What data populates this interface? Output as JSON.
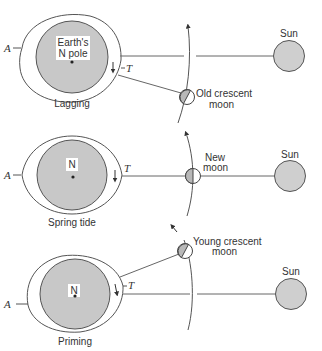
{
  "figure": {
    "colors": {
      "earth_fill": "#c8c8c8",
      "sun_fill": "#cfcfcf",
      "moon_shade": "#b8b8b8",
      "line": "#555555"
    },
    "panels": [
      {
        "name": "lagging",
        "earth_label_line1": "Earth's",
        "earth_label_line2": "N pole",
        "caption": "Lagging",
        "a_label": "A",
        "t_label": "T",
        "moon_label_line1": "Old crescent",
        "moon_label_line2": "moon",
        "sun_label": "Sun"
      },
      {
        "name": "spring-tide",
        "earth_label_line1": "N",
        "caption": "Spring tide",
        "a_label": "A",
        "t_label": "T",
        "moon_label_line1": "New",
        "moon_label_line2": "moon",
        "sun_label": "Sun"
      },
      {
        "name": "priming",
        "earth_label_line1": "N",
        "caption": "Priming",
        "a_label": "A",
        "t_label": "T",
        "moon_label_line1": "Young crescent",
        "moon_label_line2": "moon",
        "sun_label": "Sun"
      }
    ]
  }
}
